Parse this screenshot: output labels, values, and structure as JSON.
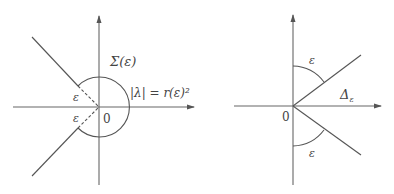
{
  "left_diagram": {
    "region_label": "Σ(ε)",
    "circle_label": "|λ| = r(ε)²",
    "origin_label": "0",
    "angle_label_upper": "ε",
    "angle_label_lower": "ε"
  },
  "right_diagram": {
    "sector_label": "Δ",
    "sector_subscript": "ε",
    "origin_label": "0",
    "angle_label_upper": "ε",
    "angle_label_lower": "ε"
  },
  "colors": {
    "line": "#555555",
    "text": "#444444",
    "background": "#ffffff"
  }
}
